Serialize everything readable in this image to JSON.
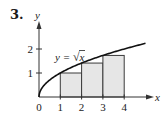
{
  "problem": {
    "number": "3."
  },
  "chart_data": {
    "type": "area",
    "title": "",
    "function_label": "y = √x",
    "function_label_parts": {
      "lhs": "y =",
      "radical": "√",
      "radicand": "x"
    },
    "xlabel": "x",
    "ylabel": "y",
    "xlim": [
      0,
      5
    ],
    "ylim": [
      0,
      2.4
    ],
    "x_ticks": [
      0,
      1,
      2,
      3,
      4
    ],
    "x_tick_labels": [
      "0",
      "1",
      "2",
      "3",
      "4"
    ],
    "y_ticks": [
      1,
      2
    ],
    "y_tick_labels": [
      "1",
      "2"
    ],
    "curve": {
      "expression": "sqrt(x)",
      "domain": [
        0,
        5
      ],
      "points": [
        [
          0,
          0
        ],
        [
          0.25,
          0.5
        ],
        [
          0.5,
          0.707
        ],
        [
          1,
          1
        ],
        [
          1.5,
          1.225
        ],
        [
          2,
          1.414
        ],
        [
          2.5,
          1.581
        ],
        [
          3,
          1.732
        ],
        [
          3.5,
          1.871
        ],
        [
          4,
          2
        ],
        [
          4.5,
          2.121
        ],
        [
          5,
          2.236
        ]
      ]
    },
    "rectangles": [
      {
        "x0": 1,
        "x1": 2,
        "height": 1.0
      },
      {
        "x0": 2,
        "x1": 3,
        "height": 1.414
      },
      {
        "x0": 3,
        "x1": 4,
        "height": 1.732
      }
    ],
    "grid": false,
    "legend": "none",
    "colors": {
      "rect_fill": "#e6e6e6",
      "rect_stroke": "#3a3a3a",
      "curve": "#111111",
      "axis": "#333333"
    }
  }
}
